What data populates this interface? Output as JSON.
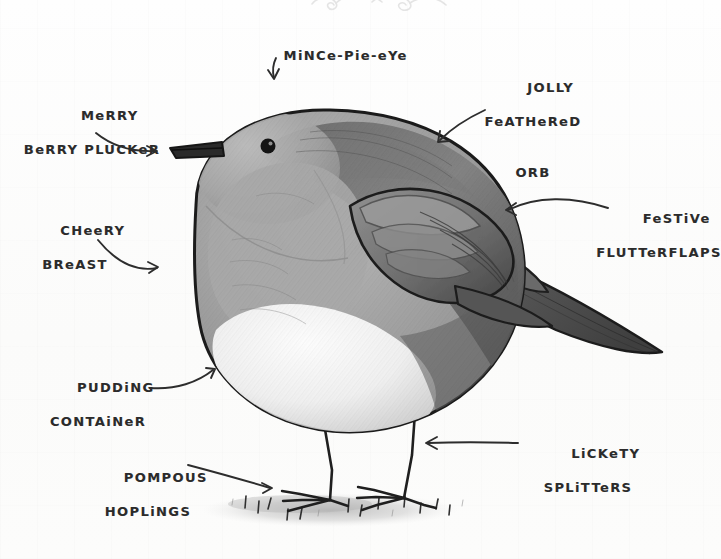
{
  "image": {
    "title": "Annotated Robin Diagram",
    "medium": "hand-drawn pencil illustration with handwritten labels",
    "subject": "robin",
    "background_color": "#fdfdfc",
    "ink_color": "#2b2b2b",
    "width": 721,
    "height": 559
  },
  "decoration": {
    "flourish_name": "pencil-scribble-flourish"
  },
  "labels": [
    {
      "id": "mince-pie-eye",
      "line1": "MiNCe-Pie-eYe",
      "line2": "",
      "points_to": "eye",
      "arrow": "down-straight"
    },
    {
      "id": "merry-berry-plucker",
      "line1": "MeRRY",
      "line2": "BeRRY PLUCKeR",
      "points_to": "beak",
      "arrow": "curve-right-down"
    },
    {
      "id": "cheery-breast",
      "line1": "CHeeRY",
      "line2": "BReAST",
      "points_to": "breast",
      "arrow": "curve-right-down"
    },
    {
      "id": "pudding-container",
      "line1": "PUDDiNG",
      "line2": "CONTAiNeR",
      "points_to": "belly",
      "arrow": "curve-right-up"
    },
    {
      "id": "pompous-hoplings",
      "line1": "POMPOUS",
      "line2": "HOPLiNGS",
      "points_to": "feet",
      "arrow": "straight-right-down"
    },
    {
      "id": "jolly-feathered-orb",
      "line1": "JOLLY",
      "line2": "FeATHeReD",
      "line3": "ORB",
      "points_to": "back",
      "arrow": "curve-left-down"
    },
    {
      "id": "festive-flutterflaps",
      "line1": "FeSTiVe",
      "line2": "FLUTTeRFLAPS",
      "points_to": "wing",
      "arrow": "curve-left"
    },
    {
      "id": "lickety-splitters",
      "line1": "LiCKeTY",
      "line2": "SPLiTTeRS",
      "points_to": "legs",
      "arrow": "straight-left"
    }
  ],
  "bird_parts": [
    "beak",
    "eye",
    "head",
    "breast",
    "belly",
    "back",
    "wing",
    "tail",
    "legs",
    "feet"
  ],
  "ground": {
    "name": "ground-smudge-with-grass-tufts"
  }
}
